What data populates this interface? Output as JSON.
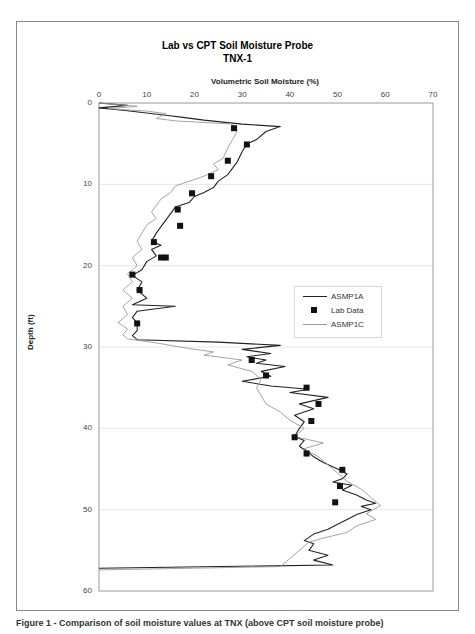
{
  "chart_data": {
    "type": "line",
    "title": "Lab vs CPT Soil Moisture Probe",
    "subtitle": "TNX-1",
    "xlabel": "Volumetric Soil Moisture (%)",
    "ylabel": "Depth (ft)",
    "xlim": [
      0,
      70
    ],
    "ylim": [
      0,
      60
    ],
    "y_inverted": true,
    "x_axis_position": "top",
    "x_ticks": [
      0,
      10,
      20,
      30,
      40,
      50,
      60,
      70
    ],
    "y_ticks": [
      0,
      10,
      20,
      30,
      40,
      50,
      60
    ],
    "grid": "horizontal light gray at each 10 ft",
    "legend_position": "right-middle, inside plot",
    "legend": [
      "ASMP1A",
      "Lab Data",
      "ASMP1C"
    ],
    "series": [
      {
        "name": "ASMP1A",
        "style": "line",
        "color": "#222222",
        "points": [
          [
            0,
            0
          ],
          [
            6,
            0.3
          ],
          [
            0,
            0.6
          ],
          [
            5,
            0.9
          ],
          [
            14,
            1.5
          ],
          [
            18,
            1.8
          ],
          [
            22,
            2.1
          ],
          [
            30,
            2.6
          ],
          [
            38,
            2.9
          ],
          [
            35,
            3.5
          ],
          [
            33,
            4.5
          ],
          [
            31,
            5.0
          ],
          [
            30,
            6.0
          ],
          [
            29,
            7.2
          ],
          [
            28,
            8.0
          ],
          [
            27,
            8.8
          ],
          [
            25,
            9.6
          ],
          [
            24,
            10.4
          ],
          [
            22,
            11.0
          ],
          [
            20,
            11.5
          ],
          [
            19,
            12.2
          ],
          [
            16,
            12.8
          ],
          [
            15,
            13.6
          ],
          [
            14,
            14.4
          ],
          [
            13,
            15.2
          ],
          [
            12,
            16.0
          ],
          [
            11,
            17.0
          ],
          [
            13,
            17.5
          ],
          [
            11,
            18.0
          ],
          [
            12,
            18.8
          ],
          [
            10,
            19.5
          ],
          [
            9,
            20.5
          ],
          [
            7,
            21.2
          ],
          [
            9,
            22.0
          ],
          [
            8,
            23.0
          ],
          [
            10,
            24.0
          ],
          [
            7,
            24.8
          ],
          [
            16,
            25.0
          ],
          [
            8,
            25.6
          ],
          [
            7,
            26.4
          ],
          [
            8,
            27.0
          ],
          [
            8,
            28.0
          ],
          [
            7,
            28.6
          ],
          [
            8,
            29.1
          ],
          [
            25,
            29.4
          ],
          [
            38,
            29.8
          ],
          [
            30,
            30.3
          ],
          [
            36,
            30.8
          ],
          [
            31,
            31.2
          ],
          [
            35,
            31.6
          ],
          [
            33,
            32.0
          ],
          [
            39,
            32.4
          ],
          [
            34,
            33.0
          ],
          [
            36,
            33.6
          ],
          [
            30,
            34.2
          ],
          [
            36,
            34.8
          ],
          [
            44,
            35.2
          ],
          [
            40,
            35.6
          ],
          [
            48,
            36.2
          ],
          [
            42,
            37.0
          ],
          [
            45,
            37.6
          ],
          [
            41,
            38.4
          ],
          [
            43,
            39.2
          ],
          [
            42,
            40.0
          ],
          [
            41,
            41.0
          ],
          [
            43,
            41.5
          ],
          [
            42,
            42.2
          ],
          [
            44,
            43.0
          ],
          [
            45,
            43.5
          ],
          [
            47,
            44.2
          ],
          [
            50,
            45.0
          ],
          [
            52,
            45.6
          ],
          [
            51,
            46.2
          ],
          [
            49,
            46.6
          ],
          [
            53,
            47.0
          ],
          [
            51,
            47.6
          ],
          [
            54,
            48.2
          ],
          [
            56,
            48.8
          ],
          [
            58,
            49.2
          ],
          [
            55,
            49.6
          ],
          [
            57,
            50.0
          ],
          [
            54,
            50.6
          ],
          [
            52,
            51.2
          ],
          [
            50,
            51.8
          ],
          [
            48,
            52.4
          ],
          [
            45,
            53.0
          ],
          [
            43,
            53.8
          ],
          [
            45,
            54.2
          ],
          [
            44,
            55.0
          ],
          [
            48,
            55.6
          ],
          [
            45,
            56.2
          ],
          [
            49,
            56.8
          ],
          [
            0,
            57.2
          ]
        ]
      },
      {
        "name": "ASMP1C",
        "style": "line",
        "color": "#9a9a9a",
        "points": [
          [
            0,
            0
          ],
          [
            8,
            0.4
          ],
          [
            2,
            0.7
          ],
          [
            10,
            1.0
          ],
          [
            14,
            1.3
          ],
          [
            12,
            1.9
          ],
          [
            16,
            2.2
          ],
          [
            28,
            2.6
          ],
          [
            29,
            3.4
          ],
          [
            28,
            4.5
          ],
          [
            27,
            5.5
          ],
          [
            26,
            6.8
          ],
          [
            24,
            7.5
          ],
          [
            25,
            8.2
          ],
          [
            22,
            9.0
          ],
          [
            19,
            9.6
          ],
          [
            16,
            10.2
          ],
          [
            15,
            11.0
          ],
          [
            13,
            11.8
          ],
          [
            12,
            12.6
          ],
          [
            11,
            13.4
          ],
          [
            12,
            14.2
          ],
          [
            10,
            15.0
          ],
          [
            9,
            16.0
          ],
          [
            8,
            17.0
          ],
          [
            9,
            18.0
          ],
          [
            7,
            19.0
          ],
          [
            8,
            20.0
          ],
          [
            6,
            21.0
          ],
          [
            7,
            22.0
          ],
          [
            5,
            23.0
          ],
          [
            7,
            24.0
          ],
          [
            5,
            25.0
          ],
          [
            6,
            26.0
          ],
          [
            4,
            27.0
          ],
          [
            6,
            27.8
          ],
          [
            5,
            28.5
          ],
          [
            6,
            29.0
          ],
          [
            12,
            29.5
          ],
          [
            19,
            30.2
          ],
          [
            24,
            30.6
          ],
          [
            22,
            31.0
          ],
          [
            30,
            31.6
          ],
          [
            27,
            32.2
          ],
          [
            32,
            33.0
          ],
          [
            34,
            34.0
          ],
          [
            33,
            35.0
          ],
          [
            34,
            36.0
          ],
          [
            35,
            37.0
          ],
          [
            38,
            38.0
          ],
          [
            40,
            39.0
          ],
          [
            43,
            40.0
          ],
          [
            41,
            41.0
          ],
          [
            47,
            41.8
          ],
          [
            43,
            42.5
          ],
          [
            46,
            43.5
          ],
          [
            48,
            44.5
          ],
          [
            50,
            45.5
          ],
          [
            52,
            46.5
          ],
          [
            55,
            47.5
          ],
          [
            57,
            48.5
          ],
          [
            59,
            49.5
          ],
          [
            56,
            50.5
          ],
          [
            58,
            51.2
          ],
          [
            54,
            52.0
          ],
          [
            52,
            52.8
          ],
          [
            47,
            53.5
          ],
          [
            44,
            54.0
          ],
          [
            42,
            55.0
          ],
          [
            40,
            56.0
          ],
          [
            38,
            57.0
          ],
          [
            0,
            57.4
          ]
        ]
      },
      {
        "name": "Lab Data",
        "style": "marker-square",
        "color": "#111111",
        "points": [
          [
            28.3,
            3.1
          ],
          [
            31,
            5.1
          ],
          [
            27,
            7.1
          ],
          [
            23.5,
            9.0
          ],
          [
            19.5,
            11.1
          ],
          [
            16.5,
            13.1
          ],
          [
            17,
            15.1
          ],
          [
            11.5,
            17.1
          ],
          [
            13,
            19.0
          ],
          [
            14,
            19.0
          ],
          [
            7,
            21.1
          ],
          [
            8.5,
            23.0
          ],
          [
            8,
            27.1
          ],
          [
            32,
            31.6
          ],
          [
            35,
            33.5
          ],
          [
            43.5,
            35.0
          ],
          [
            46,
            37.0
          ],
          [
            44.5,
            39.1
          ],
          [
            41,
            41.1
          ],
          [
            43.5,
            43.1
          ],
          [
            51,
            45.1
          ],
          [
            50.5,
            47.1
          ],
          [
            49.5,
            49.1
          ]
        ]
      }
    ]
  },
  "caption": "Figure 1 - Comparison of soil moisture values at TNX (above CPT soil moisture probe)"
}
